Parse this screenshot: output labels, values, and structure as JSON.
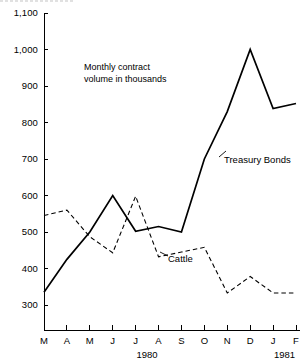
{
  "chart_data": {
    "type": "line",
    "title": "",
    "annotation": "Monthly contract\nvolume in thousands",
    "xlabel": "",
    "ylabel": "",
    "ylim": [
      300,
      1100
    ],
    "ytick_labels": [
      "1,100",
      "1,000",
      "900",
      "800",
      "700",
      "600",
      "500",
      "400",
      "300"
    ],
    "ytick_values": [
      1100,
      1000,
      900,
      800,
      700,
      600,
      500,
      400,
      300
    ],
    "grid": false,
    "legend": "inline-labels",
    "categories": [
      "M",
      "A",
      "M",
      "J",
      "J",
      "A",
      "S",
      "O",
      "N",
      "D",
      "J",
      "F"
    ],
    "period_labels": [
      {
        "text": "1980",
        "span_start": 0,
        "span_end": 9
      },
      {
        "text": "1981",
        "span_start": 10,
        "span_end": 11
      }
    ],
    "series": [
      {
        "name": "Treasury Bonds",
        "style": "solid",
        "color": "#000000",
        "label_x_index": 8,
        "values": [
          335,
          425,
          500,
          600,
          502,
          515,
          500,
          700,
          830,
          1000,
          838,
          852
        ]
      },
      {
        "name": "Cattle",
        "style": "dashed",
        "color": "#000000",
        "label_x_index": 6,
        "values": [
          545,
          560,
          487,
          443,
          598,
          432,
          445,
          458,
          333,
          378,
          333,
          333
        ]
      }
    ]
  }
}
